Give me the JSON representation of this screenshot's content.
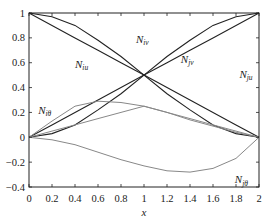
{
  "chart_data": {
    "type": "line",
    "title": "",
    "xlabel": "x",
    "ylabel": "",
    "xlim": [
      0,
      2
    ],
    "ylim": [
      -0.4,
      1
    ],
    "grid": false,
    "legend": "none (inline curve labels)",
    "x_ticks": [
      "0",
      "0.2",
      "0.4",
      "0.6",
      "0.8",
      "1",
      "1.2",
      "1.4",
      "1.6",
      "1.8",
      "2"
    ],
    "y_ticks": [
      "-0.4",
      "-0.2",
      "0",
      "0.2",
      "0.4",
      "0.6",
      "0.8",
      "1"
    ],
    "x": [
      0,
      0.2,
      0.4,
      0.6,
      0.8,
      1.0,
      1.2,
      1.4,
      1.6,
      1.8,
      2.0
    ],
    "series": [
      {
        "name": "N_iu",
        "label": "N",
        "sub": "iu",
        "color": "#222222",
        "values": [
          1.0,
          0.9,
          0.8,
          0.7,
          0.6,
          0.5,
          0.4,
          0.3,
          0.2,
          0.1,
          0.0
        ]
      },
      {
        "name": "N_ju",
        "label": "N",
        "sub": "ju",
        "color": "#222222",
        "values": [
          0.0,
          0.1,
          0.2,
          0.3,
          0.4,
          0.5,
          0.6,
          0.7,
          0.8,
          0.9,
          1.0
        ]
      },
      {
        "name": "N_iv",
        "label": "N",
        "sub": "iv",
        "color": "#222222",
        "values": [
          1.0,
          0.97,
          0.9,
          0.78,
          0.65,
          0.5,
          0.35,
          0.22,
          0.1,
          0.03,
          0.0
        ]
      },
      {
        "name": "N_jv",
        "label": "N",
        "sub": "jv",
        "color": "#222222",
        "values": [
          0.0,
          0.03,
          0.1,
          0.22,
          0.35,
          0.5,
          0.65,
          0.78,
          0.9,
          0.97,
          1.0
        ]
      },
      {
        "name": "N_iθ",
        "label": "N",
        "sub": "iθ",
        "color": "#888888",
        "values": [
          0.0,
          0.13,
          0.25,
          0.29,
          0.28,
          0.25,
          0.2,
          0.14,
          0.09,
          0.04,
          0.0
        ]
      },
      {
        "name": "N_jθ",
        "label": "N",
        "sub": "jθ",
        "color": "#888888",
        "values": [
          0.0,
          -0.02,
          -0.06,
          -0.12,
          -0.18,
          -0.23,
          -0.27,
          -0.28,
          -0.25,
          -0.17,
          0.0
        ]
      },
      {
        "name": "gray-line",
        "label": "",
        "sub": "",
        "color": "#888888",
        "values": [
          0.0,
          0.05,
          0.1,
          0.15,
          0.2,
          0.25,
          0.2,
          0.15,
          0.1,
          0.05,
          0.0
        ]
      }
    ],
    "annotations": [
      {
        "text": "N",
        "sub": "iv",
        "x": 0.93,
        "y": 0.76
      },
      {
        "text": "N",
        "sub": "jv",
        "x": 1.32,
        "y": 0.6
      },
      {
        "text": "N",
        "sub": "iu",
        "x": 0.4,
        "y": 0.56
      },
      {
        "text": "N",
        "sub": "ju",
        "x": 1.83,
        "y": 0.48
      },
      {
        "text": "N",
        "sub": "iθ",
        "x": 0.08,
        "y": 0.19
      },
      {
        "text": "N",
        "sub": "jθ",
        "x": 1.79,
        "y": -0.37
      }
    ]
  }
}
